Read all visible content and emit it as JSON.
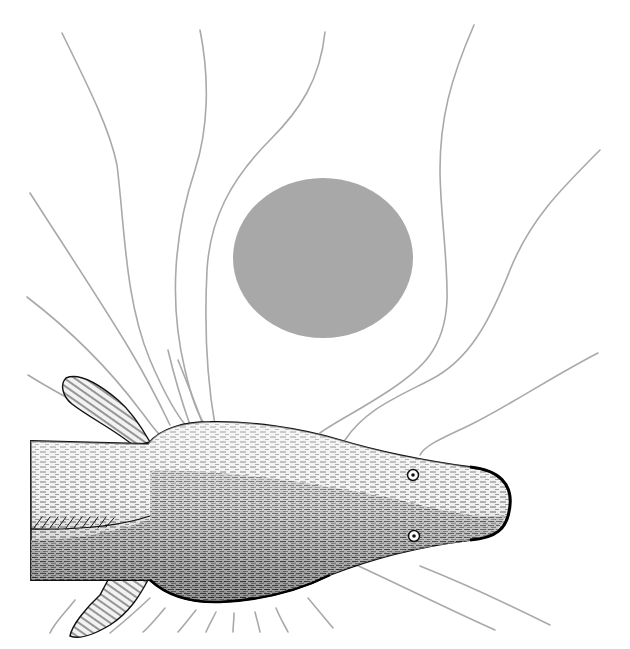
{
  "figure": {
    "description": "Electric fish (top view) with electric field lines bent around a nearby spherical object",
    "colors": {
      "background": "#ffffff",
      "field_line": "#a9a9a9",
      "object_fill": "#a8a8a8",
      "fish_ink": "#111111",
      "fish_body": "#e4e4e4"
    },
    "object": {
      "shape": "circle",
      "cx": 323,
      "cy": 258,
      "rx": 90,
      "ry": 80
    },
    "fish": {
      "orientation": "head pointing right",
      "parts": [
        "body",
        "head",
        "dorsal-pectoral-fin-top",
        "pectoral-fin-bottom",
        "eye-top",
        "eye-bottom"
      ]
    },
    "field_lines_count": 22
  }
}
